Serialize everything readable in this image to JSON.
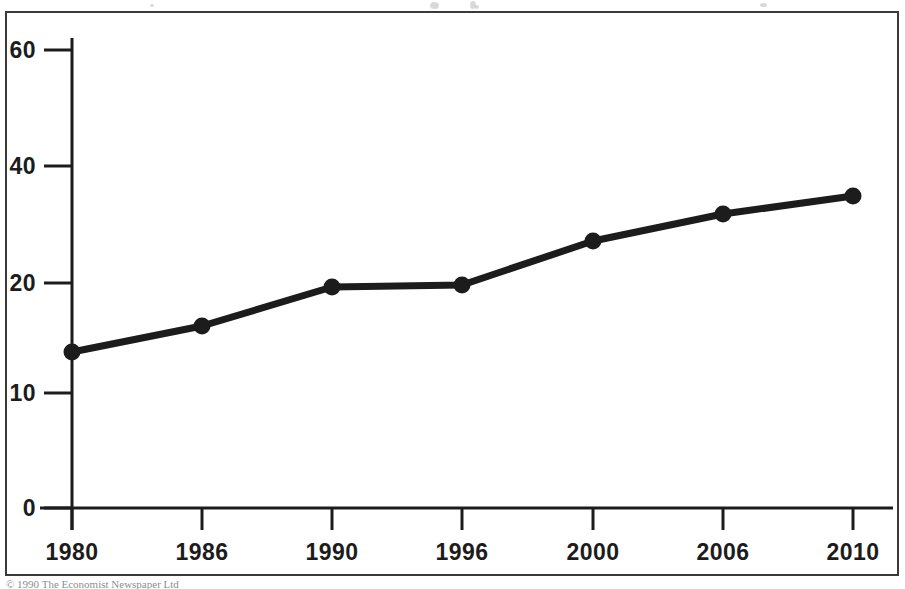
{
  "figure": {
    "border_color": "#3a3a3a",
    "ink_color": "#1c1c1c",
    "background": "#ffffff",
    "caption": "© 1990 The Economist Newspaper Ltd"
  },
  "chart_data": {
    "type": "line",
    "title": "",
    "subtitle": "",
    "xlabel": "",
    "ylabel": "",
    "categories": [
      "1980",
      "1986",
      "1990",
      "1996",
      "2000",
      "2006",
      "2010"
    ],
    "x": [
      1980,
      1986,
      1990,
      1996,
      2000,
      2006,
      2010
    ],
    "values": [
      13.7,
      15.9,
      19.4,
      19.6,
      23.4,
      25.9,
      27.3
    ],
    "series": [
      {
        "name": "series-1",
        "values": [
          13.7,
          15.9,
          19.4,
          19.6,
          23.4,
          25.9,
          27.3
        ],
        "color": "#1c1c1c",
        "marker": "circle"
      }
    ],
    "ytick_labels": [
      "0",
      "10",
      "20",
      "40",
      "60"
    ],
    "ytick_values": [
      0,
      10,
      20,
      40,
      60
    ],
    "xtick_labels": [
      "1980",
      "1986",
      "1990",
      "1996",
      "2000",
      "2006",
      "2010"
    ],
    "ylim": [
      0,
      60
    ],
    "grid": false,
    "legend": false,
    "legend_position": "none",
    "axis_style": "left-and-bottom-spine"
  },
  "yticks": [
    {
      "label": "60",
      "y": 50
    },
    {
      "label": "40",
      "y": 166
    },
    {
      "label": "20",
      "y": 283
    },
    {
      "label": "10",
      "y": 393
    },
    {
      "label": "0",
      "y": 508
    }
  ],
  "xticks": [
    {
      "label": "1980",
      "x": 72
    },
    {
      "label": "1986",
      "x": 202
    },
    {
      "label": "1990",
      "x": 332
    },
    {
      "label": "1996",
      "x": 462
    },
    {
      "label": "2000",
      "x": 593
    },
    {
      "label": "2006",
      "x": 723
    },
    {
      "label": "2010",
      "x": 853
    }
  ],
  "points": [
    {
      "label": "1980",
      "value": 13.7,
      "x": 72,
      "y": 352
    },
    {
      "label": "1986",
      "value": 15.9,
      "x": 202,
      "y": 326
    },
    {
      "label": "1990",
      "value": 19.4,
      "x": 332,
      "y": 287
    },
    {
      "label": "1996",
      "value": 19.6,
      "x": 462,
      "y": 285
    },
    {
      "label": "2000",
      "value": 23.4,
      "x": 593,
      "y": 241
    },
    {
      "label": "2006",
      "value": 25.9,
      "x": 723,
      "y": 214
    },
    {
      "label": "2010",
      "value": 27.3,
      "x": 853,
      "y": 196
    }
  ],
  "specks": [
    {
      "x": 430,
      "y": 2,
      "w": 9,
      "h": 7
    },
    {
      "x": 470,
      "y": 1,
      "w": 6,
      "h": 8
    },
    {
      "x": 475,
      "y": 5,
      "w": 4,
      "h": 4
    },
    {
      "x": 760,
      "y": 3,
      "w": 7,
      "h": 4
    },
    {
      "x": 150,
      "y": 4,
      "w": 4,
      "h": 3
    }
  ]
}
